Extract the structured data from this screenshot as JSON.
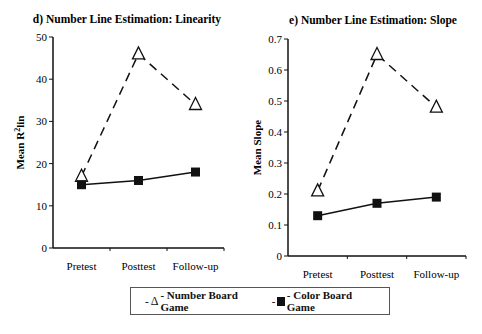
{
  "chart_data": [
    {
      "type": "line",
      "title": "d) Number Line Estimation: Linearity",
      "xlabel": "",
      "ylabel": "Mean R²lin",
      "categories": [
        "Pretest",
        "Posttest",
        "Follow-up"
      ],
      "yticks": [
        "0",
        "10",
        "20",
        "30",
        "40",
        "50"
      ],
      "ylim": [
        0,
        50
      ],
      "grid": false,
      "series": [
        {
          "name": "Number Board Game",
          "marker": "open-triangle",
          "line": "dashed",
          "values": [
            17,
            46,
            34
          ]
        },
        {
          "name": "Color Board Game",
          "marker": "filled-square",
          "line": "solid",
          "values": [
            15,
            16,
            18
          ]
        }
      ]
    },
    {
      "type": "line",
      "title": "e) Number Line Estimation: Slope",
      "xlabel": "",
      "ylabel": "Mean Slope",
      "categories": [
        "Pretest",
        "Posttest",
        "Follow-up"
      ],
      "yticks": [
        "0",
        "0.1",
        "0.2",
        "0.3",
        "0.4",
        "0.5",
        "0.6",
        "0.7"
      ],
      "ylim": [
        0,
        0.7
      ],
      "grid": false,
      "series": [
        {
          "name": "Number Board Game",
          "marker": "open-triangle",
          "line": "dashed",
          "values": [
            0.21,
            0.65,
            0.48
          ]
        },
        {
          "name": "Color Board Game",
          "marker": "filled-square",
          "line": "solid",
          "values": [
            0.13,
            0.17,
            0.19
          ]
        }
      ]
    }
  ],
  "legend": {
    "position": "bottom",
    "items": [
      {
        "symbol": "Δ",
        "prefix": "-",
        "label": "- Number Board Game"
      },
      {
        "symbol": "■",
        "prefix": "-",
        "label": "- Color Board Game"
      }
    ]
  },
  "colors": {
    "ink": "#111111",
    "background": "#ffffff"
  }
}
